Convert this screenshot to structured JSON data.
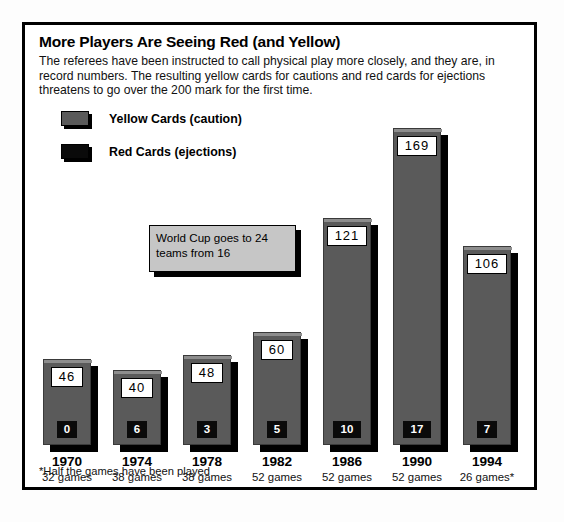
{
  "header": {
    "title": "More Players Are Seeing Red (and Yellow)",
    "deck": "The referees have been instructed to call physical play more closely, and they are, in record numbers. The resulting yellow cards for cautions and red cards for ejections threatens to go over the 200 mark for the first time."
  },
  "legend": {
    "items": [
      {
        "label": "Yellow Cards (caution)",
        "swatch": "yellowcard",
        "color": "#5a5a5a"
      },
      {
        "label": "Red Cards (ejections)",
        "swatch": "redcard",
        "color": "#0a0a0a"
      }
    ]
  },
  "annotation": {
    "text": "World Cup goes to 24 teams from 16"
  },
  "footnote": {
    "text": "*Half the games have been played"
  },
  "colors": {
    "yellow_card_bar": "#5a5a5a",
    "red_card_box": "#0a0a0a",
    "shadow": "#000000",
    "callout_fill": "#c6c6c6",
    "frame": "#000000",
    "page": "#ffffff"
  },
  "chart_data": {
    "type": "bar",
    "title": "More Players Are Seeing Red (and Yellow)",
    "xlabel": "",
    "ylabel": "",
    "grid": false,
    "legend_position": "top-left",
    "stacked": false,
    "ylim": [
      0,
      180
    ],
    "categories": [
      "1970",
      "1974",
      "1978",
      "1982",
      "1986",
      "1990",
      "1994"
    ],
    "tick_sublabels": [
      "32 games",
      "38 games",
      "38 games",
      "52 games",
      "52 games",
      "52 games",
      "26 games*"
    ],
    "series": [
      {
        "name": "Yellow Cards (caution)",
        "values": [
          46,
          40,
          48,
          60,
          121,
          169,
          106
        ]
      },
      {
        "name": "Red Cards (ejections)",
        "values": [
          0,
          6,
          3,
          5,
          10,
          17,
          7
        ]
      }
    ],
    "annotations": [
      {
        "text": "World Cup goes to 24 teams from 16",
        "points_to": "1982"
      }
    ],
    "footnote": "*Half the games have been played"
  },
  "bars": [
    {
      "year": "1970",
      "games": "32 games",
      "yellow": "46",
      "red": "0"
    },
    {
      "year": "1974",
      "games": "38 games",
      "yellow": "40",
      "red": "6"
    },
    {
      "year": "1978",
      "games": "38 games",
      "yellow": "48",
      "red": "3"
    },
    {
      "year": "1982",
      "games": "52 games",
      "yellow": "60",
      "red": "5"
    },
    {
      "year": "1986",
      "games": "52 games",
      "yellow": "121",
      "red": "10"
    },
    {
      "year": "1990",
      "games": "52 games",
      "yellow": "169",
      "red": "17"
    },
    {
      "year": "1994",
      "games": "26 games*",
      "yellow": "106",
      "red": "7"
    }
  ]
}
